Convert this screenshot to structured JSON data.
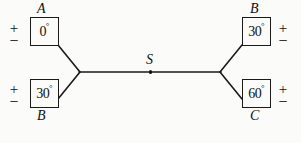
{
  "diagram": {
    "background_color": "#fbfbf9",
    "line_color": "#1a1a1a",
    "text_color": "#101010",
    "center": {
      "label": "S",
      "dot_name": "center-junction-dot"
    },
    "sources": [
      {
        "id": "top-left",
        "name": "A",
        "angle": "0",
        "degree_symbol": "°",
        "plus": "+",
        "minus": "−",
        "name_position": "above",
        "polarity_side": "left"
      },
      {
        "id": "bottom-left",
        "name": "B",
        "angle": "30",
        "degree_symbol": "°",
        "plus": "+",
        "minus": "−",
        "name_position": "below",
        "polarity_side": "left"
      },
      {
        "id": "top-right",
        "name": "B",
        "angle": "30",
        "degree_symbol": "°",
        "plus": "+",
        "minus": "−",
        "name_position": "above",
        "polarity_side": "right"
      },
      {
        "id": "bottom-right",
        "name": "C",
        "angle": "60",
        "degree_symbol": "°",
        "plus": "+",
        "minus": "−",
        "name_position": "below",
        "polarity_side": "right"
      }
    ],
    "wires": [
      {
        "name": "wire-top-left-to-left-junction",
        "x1": 58,
        "y1": 45,
        "x2": 80,
        "y2": 72
      },
      {
        "name": "wire-bottom-left-to-left-junction",
        "x1": 58,
        "y1": 99,
        "x2": 80,
        "y2": 72
      },
      {
        "name": "wire-left-junction-to-right-junction",
        "x1": 80,
        "y1": 72,
        "x2": 220,
        "y2": 72
      },
      {
        "name": "wire-right-junction-to-top-right",
        "x1": 220,
        "y1": 72,
        "x2": 242,
        "y2": 45
      },
      {
        "name": "wire-right-junction-to-bottom-right",
        "x1": 220,
        "y1": 72,
        "x2": 242,
        "y2": 99
      }
    ]
  }
}
